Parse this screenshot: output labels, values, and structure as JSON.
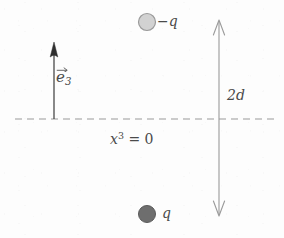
{
  "figure": {
    "background_color": "#fdfdfd",
    "stroke_color": "#8a8a8a",
    "text_color": "#4a4a4a",
    "width": 284,
    "height": 238
  },
  "axis": {
    "dashed_line": {
      "name": "plane x3 = 0",
      "y": 119,
      "x_start": 15,
      "x_end": 275,
      "style": "dashed",
      "color": "#9a9a9a"
    },
    "label": {
      "base": "x",
      "superscript": "3",
      "equals": " = 0",
      "full_text": "x³ = 0"
    }
  },
  "basis_vector": {
    "name": "e3",
    "label_base": "e",
    "label_subscript": "3",
    "full_text": "e⃗3",
    "shaft_x": 54,
    "tail_y": 119,
    "tip_y": 43,
    "arrowhead_style": "solid-filled",
    "color": "#3b3b3b"
  },
  "charges": [
    {
      "name": "negative-charge",
      "label": "−q",
      "cx": 147,
      "cy": 22,
      "r": 8.5,
      "fill": "#d2d2d2",
      "stroke": "#9a9a9a"
    },
    {
      "name": "positive-charge",
      "label": "q",
      "cx": 147,
      "cy": 214,
      "r": 8.5,
      "fill": "#6e6e6e",
      "stroke": "#5a5a5a"
    }
  ],
  "separation": {
    "name": "separation-dimension",
    "label": "2d",
    "shaft_x": 219,
    "top_y": 20,
    "bottom_y": 216,
    "arrowhead_style": "thin-open",
    "color": "#8f8f8f"
  }
}
